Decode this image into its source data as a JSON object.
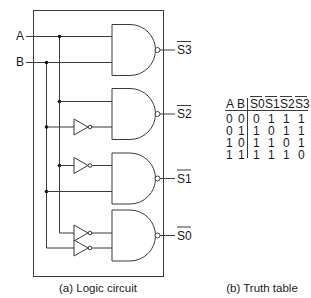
{
  "circuit": {
    "inputs": [
      {
        "name": "A",
        "label": "A"
      },
      {
        "name": "B",
        "label": "B"
      }
    ],
    "outputs": [
      {
        "name": "S3",
        "label": "S3",
        "inverted": true
      },
      {
        "name": "S2",
        "label": "S2",
        "inverted": true
      },
      {
        "name": "S1",
        "label": "S1",
        "inverted": true
      },
      {
        "name": "S0",
        "label": "S0",
        "inverted": true
      }
    ],
    "gates": [
      {
        "type": "NAND",
        "output": "S3",
        "inputs": [
          "A",
          "B"
        ]
      },
      {
        "type": "NAND",
        "output": "S2",
        "inputs": [
          "A",
          "NOT B"
        ]
      },
      {
        "type": "NAND",
        "output": "S1",
        "inputs": [
          "NOT A",
          "B"
        ]
      },
      {
        "type": "NAND",
        "output": "S0",
        "inputs": [
          "NOT A",
          "NOT B"
        ]
      }
    ],
    "caption": "(a) Logic circuit"
  },
  "truth_table": {
    "headers": [
      "A",
      "B",
      "S0",
      "S1",
      "S2",
      "S3"
    ],
    "overlined_headers": [
      "S0",
      "S1",
      "S2",
      "S3"
    ],
    "rows": [
      [
        "0",
        "0",
        "0",
        "1",
        "1",
        "1"
      ],
      [
        "0",
        "1",
        "1",
        "0",
        "1",
        "1"
      ],
      [
        "1",
        "0",
        "1",
        "1",
        "0",
        "1"
      ],
      [
        "1",
        "1",
        "1",
        "1",
        "1",
        "0"
      ]
    ],
    "caption": "(b) Truth table"
  }
}
